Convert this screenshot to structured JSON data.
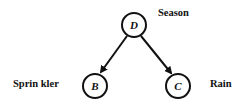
{
  "diagram": {
    "type": "bayesian-network",
    "nodes": [
      {
        "id": "D",
        "letter": "D",
        "label": "Season"
      },
      {
        "id": "B",
        "letter": "B",
        "label": "Sprin kler"
      },
      {
        "id": "C",
        "letter": "C",
        "label": "Rain"
      }
    ],
    "edges": [
      {
        "from": "D",
        "to": "B"
      },
      {
        "from": "D",
        "to": "C"
      }
    ],
    "colors": {
      "stroke": "#111111",
      "background": "#ffffff"
    }
  }
}
